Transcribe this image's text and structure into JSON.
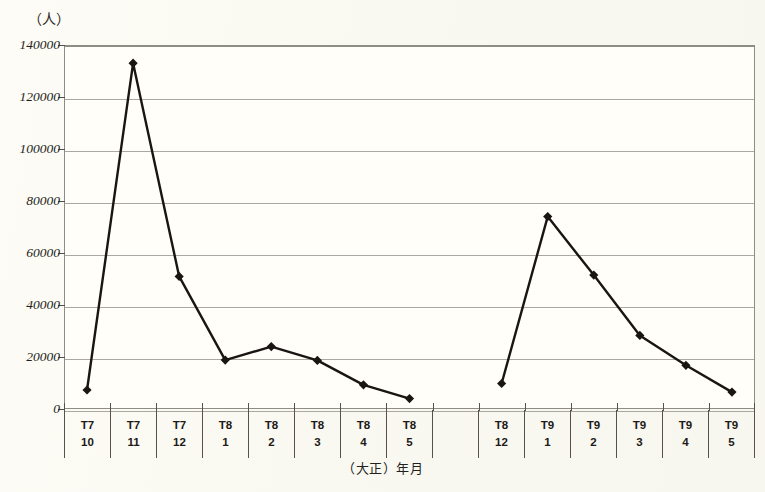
{
  "chart_data": {
    "type": "line",
    "title": "",
    "subtitle": "",
    "ylabel": "（人）",
    "xlabel": "（大正）年月",
    "ylim": [
      0,
      140000
    ],
    "ytick_step": 20000,
    "yticks": [
      "0",
      "20000",
      "40000",
      "60000",
      "80000",
      "100000",
      "120000",
      "140000"
    ],
    "grid": true,
    "legend": "none",
    "marker": "diamond",
    "line_color": "#181512",
    "categories": [
      {
        "era": "T7",
        "month": "10"
      },
      {
        "era": "T7",
        "month": "11"
      },
      {
        "era": "T7",
        "month": "12"
      },
      {
        "era": "T8",
        "month": "1"
      },
      {
        "era": "T8",
        "month": "2"
      },
      {
        "era": "T8",
        "month": "3"
      },
      {
        "era": "T8",
        "month": "4"
      },
      {
        "era": "T8",
        "month": "5"
      },
      {
        "era": "",
        "month": ""
      },
      {
        "era": "T8",
        "month": "12"
      },
      {
        "era": "T9",
        "month": "1"
      },
      {
        "era": "T9",
        "month": "2"
      },
      {
        "era": "T9",
        "month": "3"
      },
      {
        "era": "T9",
        "month": "4"
      },
      {
        "era": "T9",
        "month": "5"
      }
    ],
    "series": [
      {
        "name": "死亡者数",
        "segments": [
          {
            "indices": [
              0,
              1,
              2,
              3,
              4,
              5,
              6,
              7
            ],
            "values": [
              7300,
              133000,
              51000,
              18800,
              24000,
              18700,
              9300,
              4000
            ]
          },
          {
            "indices": [
              9,
              10,
              11,
              12,
              13,
              14
            ],
            "values": [
              9800,
              74000,
              51500,
              28300,
              16800,
              6500
            ]
          }
        ]
      }
    ],
    "values_flat": [
      7300,
      133000,
      51000,
      18800,
      24000,
      18700,
      9300,
      4000,
      null,
      9800,
      74000,
      51500,
      28300,
      16800,
      6500
    ]
  }
}
